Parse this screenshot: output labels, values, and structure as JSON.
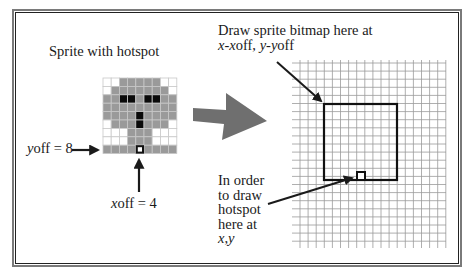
{
  "sprite_label": "Sprite with hotspot",
  "yoff_label": {
    "var": "y",
    "rest": "off = 8"
  },
  "xoff_label": {
    "var": "x",
    "rest": "off = 4"
  },
  "draw_label": {
    "line1": "Draw sprite bitmap here at",
    "line2_x": "x",
    "line2_mid1": "-",
    "line2_xoff_var": "x",
    "line2_xoff_rest": "off, ",
    "line2_y": "y",
    "line2_mid2": "-",
    "line2_yoff_var": "y",
    "line2_yoff_rest": "off"
  },
  "hotspot_label": {
    "lines": [
      "In order",
      "to draw",
      "hotspot",
      "here at"
    ],
    "last_x": "x",
    "last_comma": ",",
    "last_y": "y"
  },
  "sprite": {
    "cols": 9,
    "rows": 9,
    "xoff": 4,
    "yoff": 8,
    "colors": {
      "W": "#ffffff",
      "G": "#9a9a9a",
      "B": "#0a0a0a",
      "grid": "#c8c8c8"
    },
    "cells": [
      "WWGGGGGWW",
      "WGGGGGGGW",
      "GGBBGBBGG",
      "GGGGGGGGG",
      "GGGGBGGGG",
      "WGGGBGGGW",
      "WWWGGGWWW",
      "WWWGGGWWW",
      "GGGGGGGGG"
    ]
  },
  "colors": {
    "big_arrow": "#6f6f6f",
    "ink": "#1a1a1a",
    "grid_line": "#9a9a9a"
  }
}
